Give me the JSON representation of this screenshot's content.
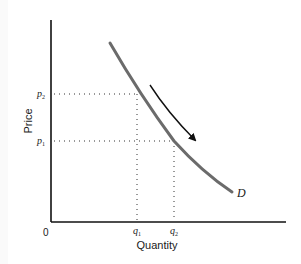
{
  "diagram": {
    "axes": {
      "x_label": "Quantity",
      "y_label": "Price",
      "origin_label": "0"
    },
    "curve": {
      "label": "D",
      "color": "#6b6b6b"
    },
    "points": [
      {
        "price_label": "p",
        "price_sub": "2",
        "quantity_label": "q",
        "quantity_sub": "1"
      },
      {
        "price_label": "p",
        "price_sub": "1",
        "quantity_label": "q",
        "quantity_sub": "2"
      }
    ],
    "arrow": {
      "meaning": "movement-along-demand-curve",
      "color": "#111111"
    },
    "colors": {
      "axis": "#111111",
      "guides": "#333333"
    }
  }
}
